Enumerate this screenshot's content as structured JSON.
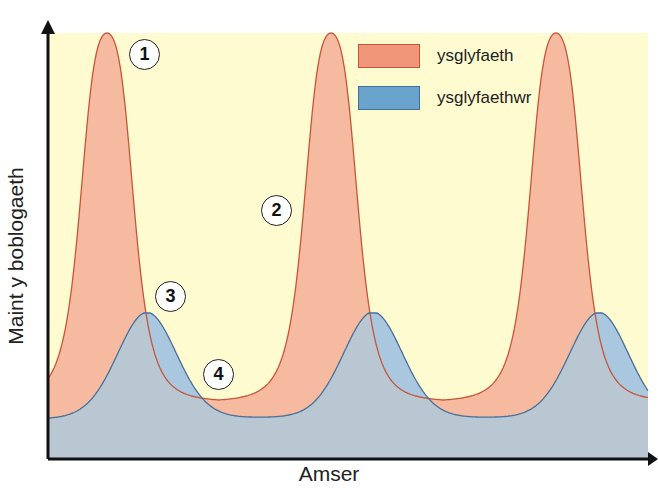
{
  "chart_data": {
    "type": "area",
    "title": "",
    "xlabel": "Amser",
    "ylabel": "Maint y boblogaeth",
    "grid": false,
    "legend_position": "top-right",
    "x_ticks": [],
    "y_ticks": [],
    "series": [
      {
        "name": "ysglyfaeth",
        "color": "#f2b39a",
        "line_color": "#c8553a",
        "peaks_x": [
          107,
          331,
          556
        ],
        "peak_value": 100,
        "trough_value": 4,
        "description": "Prey population: periodic sharp peaks"
      },
      {
        "name": "ysglyfaethwr",
        "color": "#8fb3cf",
        "line_color": "#4a6f99",
        "peaks_x": [
          147,
          373,
          599
        ],
        "peak_value": 28,
        "trough_value": 0,
        "description": "Predator population: smaller peaks lagging behind prey peaks"
      }
    ],
    "annotations": [
      {
        "label": "1",
        "description": "prey peak"
      },
      {
        "label": "2",
        "description": "prey decline"
      },
      {
        "label": "3",
        "description": "predator peak"
      },
      {
        "label": "4",
        "description": "predator decline / prey trough"
      }
    ]
  },
  "legend": {
    "items": [
      {
        "label": "ysglyfaeth",
        "color": "#f0977a",
        "border": "#c8553a"
      },
      {
        "label": "ysglyfaethwr",
        "color": "#6aa3cc",
        "border": "#3f6e96"
      }
    ]
  },
  "axes": {
    "x_label": "Amser",
    "y_label": "Maint y boblogaeth"
  },
  "markers": [
    "1",
    "2",
    "3",
    "4"
  ],
  "colors": {
    "background": "#fefbd0",
    "prey_fill": "#f5b8a0",
    "predator_fill": "#b8c8d6",
    "overlap_fill": "#b5c4d0"
  }
}
